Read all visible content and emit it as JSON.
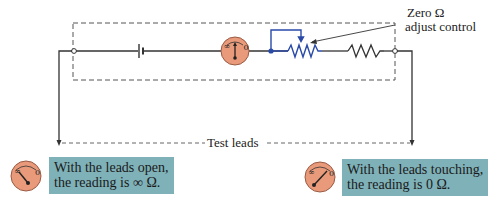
{
  "annotation": {
    "line1": "Zero Ω",
    "line2": "adjust control"
  },
  "test_leads_label": "Test leads",
  "meter_scale": {
    "left_mark": "∞",
    "right_mark": "0"
  },
  "captions": {
    "open": {
      "line1": "With the leads open,",
      "line2": "the reading is ∞ Ω."
    },
    "touching": {
      "line1": "With the leads touching,",
      "line2": "the reading is 0 Ω."
    }
  },
  "colors": {
    "meter_fill": "#e89a7a",
    "caption_bg": "#7fb1b8",
    "rheostat": "#2a4aa8",
    "wire": "#333333"
  }
}
